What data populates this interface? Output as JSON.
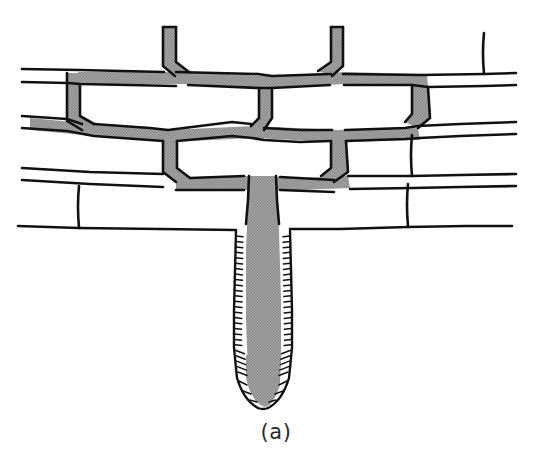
{
  "figure": {
    "caption": "(a)",
    "background_color": "#ffffff",
    "ink_color": "#111111",
    "fill_color": "#9a9a9a",
    "caption_color": "#2b2b2b",
    "canvas": {
      "width": 552,
      "height": 471
    }
  },
  "legend_semantics": {
    "brick_label": "brick",
    "mortar_joint_label": "mortar joint",
    "root_label": "root",
    "root_hair_label": "root hair"
  },
  "chart_data": {
    "type": "diagram",
    "title": "(a)",
    "elements": [
      {
        "name": "wall-course-1",
        "kind": "brick-course",
        "row": 1
      },
      {
        "name": "wall-course-2",
        "kind": "brick-course",
        "row": 2
      },
      {
        "name": "wall-course-3",
        "kind": "brick-course",
        "row": 3
      },
      {
        "name": "root-main-stem",
        "kind": "root",
        "filled": true
      },
      {
        "name": "root-branch-left",
        "kind": "root-branch",
        "filled": true
      },
      {
        "name": "root-branch-right",
        "kind": "root-branch",
        "filled": true
      },
      {
        "name": "root-tip",
        "kind": "root-tip",
        "filled": true
      },
      {
        "name": "root-hairs",
        "kind": "hatching",
        "count": 56
      }
    ]
  }
}
